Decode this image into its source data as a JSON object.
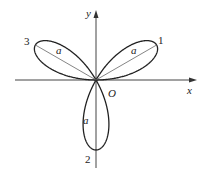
{
  "diagram": {
    "type": "polar-rose",
    "origin_label": "O",
    "x_axis_label": "x",
    "y_axis_label": "y",
    "leaves": [
      {
        "number": "1",
        "length_label": "a",
        "angle_deg": 30
      },
      {
        "number": "2",
        "length_label": "a",
        "angle_deg": 270
      },
      {
        "number": "3",
        "length_label": "a",
        "angle_deg": 150
      }
    ],
    "colors": {
      "curve": "#222222",
      "axis": "#444444",
      "radius_line": "#666666"
    }
  }
}
